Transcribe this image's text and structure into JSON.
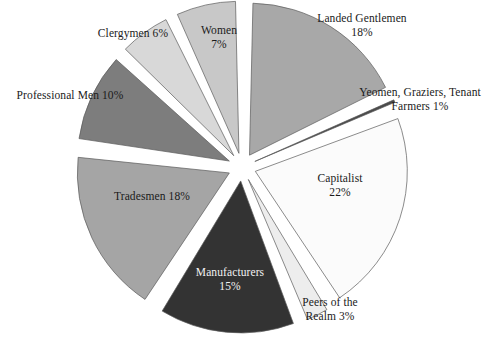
{
  "chart_data": {
    "type": "pie",
    "title": "",
    "subtitle": "",
    "xlabel": "",
    "ylabel": "",
    "legend_position": "labels-on-slices",
    "grid": false,
    "exploded": true,
    "units": "percent",
    "categories": [
      "Landed Gentlemen",
      "Yeomen, Graziers, Tenant Farmers",
      "Capitalist",
      "Peers of the Realm",
      "Manufacturers",
      "Tradesmen",
      "Professional Men",
      "Clergymen",
      "Women"
    ],
    "values": [
      18,
      1,
      22,
      3,
      15,
      18,
      10,
      6,
      7
    ],
    "slices": [
      {
        "key": "landed-gentlemen",
        "label": "Landed Gentlemen",
        "percent_text": "18%",
        "value": 18,
        "fill": "#a8a8a8",
        "label_placement": "outside",
        "label_lines": [
          "Landed Gentlemen",
          "18%"
        ]
      },
      {
        "key": "yeomen-graziers-tenant-farmers",
        "label": "Yeomen, Graziers, Tenant Farmers",
        "percent_text": "1%",
        "value": 1,
        "fill": "#4a4a4a",
        "label_placement": "outside",
        "label_lines": [
          "Yeomen, Graziers, Tenant",
          "Farmers 1%"
        ]
      },
      {
        "key": "capitalist",
        "label": "Capitalist",
        "percent_text": "22%",
        "value": 22,
        "fill": "#fbfbfb",
        "label_placement": "inside",
        "label_lines": [
          "Capitalist",
          "22%"
        ]
      },
      {
        "key": "peers-of-the-realm",
        "label": "Peers of the Realm",
        "percent_text": "3%",
        "value": 3,
        "fill": "#ededed",
        "label_placement": "outside",
        "label_lines": [
          "Peers of the",
          "Realm 3%"
        ]
      },
      {
        "key": "manufacturers",
        "label": "Manufacturers",
        "percent_text": "15%",
        "value": 15,
        "fill": "#333333",
        "label_placement": "inside-dark",
        "label_lines": [
          "Manufacturers",
          "15%"
        ]
      },
      {
        "key": "tradesmen",
        "label": "Tradesmen",
        "percent_text": "18%",
        "value": 18,
        "fill": "#a5a5a5",
        "label_placement": "inside",
        "label_lines": [
          "Tradesmen 18%"
        ]
      },
      {
        "key": "professional-men",
        "label": "Professional Men",
        "percent_text": "10%",
        "value": 10,
        "fill": "#7d7d7d",
        "label_placement": "outside",
        "label_lines": [
          "Professional Men  10%"
        ]
      },
      {
        "key": "clergymen",
        "label": "Clergymen",
        "percent_text": "6%",
        "value": 6,
        "fill": "#d8d8d8",
        "label_placement": "outside",
        "label_lines": [
          "Clergymen 6%"
        ]
      },
      {
        "key": "women",
        "label": "Women",
        "percent_text": "7%",
        "value": 7,
        "fill": "#c8c8c8",
        "label_placement": "inside",
        "label_lines": [
          "Women",
          "7%"
        ]
      }
    ]
  },
  "labels": {
    "landed": {
      "l1": "Landed Gentlemen",
      "l2": "18%"
    },
    "yeomen": {
      "l1": "Yeomen, Graziers, Tenant",
      "l2": "Farmers 1%"
    },
    "capitalist": {
      "l1": "Capitalist",
      "l2": "22%"
    },
    "peers": {
      "l1": "Peers of the",
      "l2": "Realm 3%"
    },
    "manufacturers": {
      "l1": "Manufacturers",
      "l2": "15%"
    },
    "tradesmen": {
      "l1": "Tradesmen 18%"
    },
    "professional": {
      "l1": "Professional Men  10%"
    },
    "clergymen": {
      "l1": "Clergymen 6%"
    },
    "women": {
      "l1": "Women",
      "l2": "7%"
    }
  },
  "colors": {
    "background": "#ffffff",
    "outline": "#5a5a5a",
    "text": "#1a1a1a",
    "text_on_dark": "#f2f2f2"
  }
}
